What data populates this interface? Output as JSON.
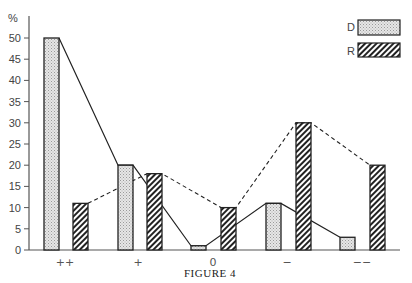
{
  "chart_data": {
    "type": "bar",
    "title": "",
    "caption": "Figure 4",
    "xlabel": "",
    "ylabel": "%",
    "ylim": [
      0,
      50
    ],
    "yticks": [
      0,
      5,
      10,
      15,
      20,
      25,
      30,
      35,
      40,
      45,
      50
    ],
    "grid": false,
    "legend_position": "top-right",
    "categories": [
      "++",
      "+",
      "0",
      "−",
      "−−"
    ],
    "series": [
      {
        "name": "D",
        "pattern": "dotted-gray",
        "line": "solid",
        "values": [
          50,
          20,
          1,
          11,
          3
        ]
      },
      {
        "name": "R",
        "pattern": "diagonal-hatch",
        "line": "dashed",
        "values": [
          11,
          18,
          10,
          30,
          20
        ]
      }
    ]
  },
  "colors": {
    "axis": "#555555",
    "bar_outline": "#222222",
    "d_fill": "#d8d8d8",
    "r_hatch": "#222222"
  }
}
